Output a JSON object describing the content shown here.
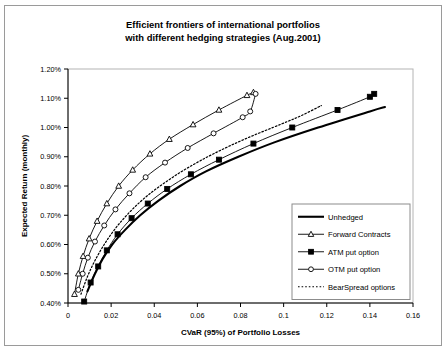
{
  "chart_data": {
    "type": "line",
    "title": "Efficient frontiers of international portfolios with different hedging strategies (Aug.2001)",
    "title_line1": "Efficient frontiers of international portfolios",
    "title_line2": "with different hedging strategies (Aug.2001)",
    "xlabel": "CVaR (95%) of  Portfolio Losses",
    "ylabel": "Expected Return (monthly)",
    "xlim": [
      0,
      0.16
    ],
    "ylim": [
      0.4,
      1.2
    ],
    "xticks": [
      0,
      0.02,
      0.04,
      0.06,
      0.08,
      0.1,
      0.12,
      0.14,
      0.16
    ],
    "xticklabels": [
      "0",
      "0.02",
      "0.04",
      "0.06",
      "0.08",
      "0.1",
      "0.12",
      "0.14",
      "0.16"
    ],
    "yticks": [
      0.4,
      0.5,
      0.6,
      0.7,
      0.8,
      0.9,
      1.0,
      1.1,
      1.2
    ],
    "yticklabels": [
      "0.40%",
      "0.50%",
      "0.60%",
      "0.70%",
      "0.80%",
      "0.90%",
      "1.00%",
      "1.10%",
      "1.20%"
    ],
    "grid": false,
    "legend_position": "lower-right-inside",
    "series": [
      {
        "name": "Unhedged",
        "marker": "none",
        "linestyle": "solid",
        "linewidth": 2.1,
        "points": [
          [
            0.009,
            0.44
          ],
          [
            0.0125,
            0.5
          ],
          [
            0.016,
            0.55
          ],
          [
            0.0205,
            0.6
          ],
          [
            0.0265,
            0.65
          ],
          [
            0.0335,
            0.7
          ],
          [
            0.042,
            0.75
          ],
          [
            0.052,
            0.8
          ],
          [
            0.064,
            0.85
          ],
          [
            0.079,
            0.9
          ],
          [
            0.096,
            0.95
          ],
          [
            0.116,
            1.0
          ],
          [
            0.14,
            1.055
          ],
          [
            0.147,
            1.07
          ]
        ]
      },
      {
        "name": "Forward Contracts",
        "marker": "triangle",
        "linestyle": "solid",
        "linewidth": 0.9,
        "points": [
          [
            0.003,
            0.43
          ],
          [
            0.0048,
            0.5
          ],
          [
            0.007,
            0.56
          ],
          [
            0.0098,
            0.62
          ],
          [
            0.0135,
            0.68
          ],
          [
            0.018,
            0.74
          ],
          [
            0.0235,
            0.8
          ],
          [
            0.03,
            0.855
          ],
          [
            0.038,
            0.91
          ],
          [
            0.047,
            0.96
          ],
          [
            0.058,
            1.01
          ],
          [
            0.07,
            1.06
          ],
          [
            0.083,
            1.11
          ],
          [
            0.086,
            1.12
          ]
        ]
      },
      {
        "name": "ATM put option",
        "marker": "square",
        "linestyle": "solid",
        "linewidth": 0.9,
        "points": [
          [
            0.0075,
            0.405
          ],
          [
            0.0105,
            0.47
          ],
          [
            0.014,
            0.525
          ],
          [
            0.018,
            0.58
          ],
          [
            0.023,
            0.635
          ],
          [
            0.0295,
            0.69
          ],
          [
            0.037,
            0.74
          ],
          [
            0.046,
            0.79
          ],
          [
            0.057,
            0.84
          ],
          [
            0.07,
            0.89
          ],
          [
            0.086,
            0.945
          ],
          [
            0.104,
            1.0
          ],
          [
            0.125,
            1.06
          ],
          [
            0.14,
            1.105
          ],
          [
            0.142,
            1.115
          ]
        ]
      },
      {
        "name": "OTM put option",
        "marker": "circle",
        "linestyle": "solid",
        "linewidth": 0.9,
        "points": [
          [
            0.0048,
            0.445
          ],
          [
            0.0068,
            0.5
          ],
          [
            0.0092,
            0.555
          ],
          [
            0.0125,
            0.61
          ],
          [
            0.0168,
            0.665
          ],
          [
            0.022,
            0.72
          ],
          [
            0.0285,
            0.775
          ],
          [
            0.036,
            0.83
          ],
          [
            0.045,
            0.88
          ],
          [
            0.0555,
            0.93
          ],
          [
            0.0675,
            0.98
          ],
          [
            0.081,
            1.035
          ],
          [
            0.0845,
            1.055
          ],
          [
            0.087,
            1.115
          ]
        ]
      },
      {
        "name": "BearSpread options",
        "marker": "none",
        "linestyle": "dotted",
        "linewidth": 1.2,
        "points": [
          [
            0.006,
            0.43
          ],
          [
            0.009,
            0.49
          ],
          [
            0.0125,
            0.545
          ],
          [
            0.0168,
            0.6
          ],
          [
            0.022,
            0.655
          ],
          [
            0.0285,
            0.71
          ],
          [
            0.036,
            0.762
          ],
          [
            0.045,
            0.812
          ],
          [
            0.0555,
            0.862
          ],
          [
            0.068,
            0.912
          ],
          [
            0.0825,
            0.962
          ],
          [
            0.099,
            1.012
          ],
          [
            0.108,
            1.04
          ],
          [
            0.1175,
            1.075
          ]
        ]
      }
    ],
    "legend_entries": [
      {
        "label": "Unhedged",
        "marker": "none",
        "linestyle": "solid",
        "linewidth": 2.1
      },
      {
        "label": "Forward Contracts",
        "marker": "triangle",
        "linestyle": "solid",
        "linewidth": 0.9
      },
      {
        "label": "ATM put option",
        "marker": "square",
        "linestyle": "solid",
        "linewidth": 0.9
      },
      {
        "label": "OTM put option",
        "marker": "circle",
        "linestyle": "solid",
        "linewidth": 0.9
      },
      {
        "label": "BearSpread options",
        "marker": "none",
        "linestyle": "dotted",
        "linewidth": 1.2
      }
    ],
    "colors": {
      "line": "#000000",
      "axis": "#000000",
      "frame": "#b4b4b4",
      "background": "#ffffff",
      "border": "#9a9a9a"
    }
  }
}
